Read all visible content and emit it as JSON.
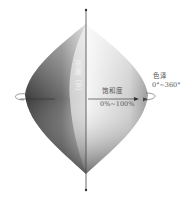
{
  "diagram": {
    "type": "hsb-double-cone",
    "axis_label": "亮度（B）",
    "hue": {
      "title": "色泽",
      "range": "0°~360°"
    },
    "saturation": {
      "title": "饱和度",
      "range": "0%~100%"
    },
    "colors": {
      "dark": "#3a3a3a",
      "mid": "#8a8a8a",
      "light": "#f2f2f2",
      "axis": "#444444",
      "text": "#555555"
    }
  }
}
